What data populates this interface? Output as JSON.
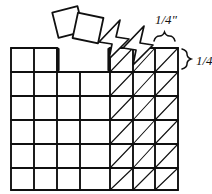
{
  "diagram": {
    "ink_color": "#101010",
    "paper_color": "#ffffff",
    "labels": {
      "top_measure": "1/4\"",
      "top_measure_numerator": "1",
      "top_measure_denominator": "4",
      "top_measure_unit": "”",
      "right_measure": "1/4\"",
      "right_measure_numerator": "1",
      "right_measure_denominator": "4",
      "right_measure_unit": "”"
    },
    "grid": {
      "columns": 7,
      "rows": 6,
      "cell_width_px": 24,
      "cell_height_px": 24,
      "left_px": 11,
      "top_px": 48,
      "right_px": 178,
      "bottom_px": 190,
      "x_lines": [
        11,
        34,
        57,
        80,
        110,
        133,
        155,
        178
      ],
      "y_lines": [
        48,
        72,
        96,
        120,
        144,
        168,
        190
      ],
      "top_row_segments": [
        {
          "from_x": 11,
          "to_x": 57,
          "hatched": false
        },
        {
          "from_x": 110,
          "to_x": 178,
          "hatched": true
        }
      ],
      "hatch_start_x": 110,
      "hatched_note": "diagonal lines run lower-left to upper-right"
    },
    "annotations": {
      "brace_top": {
        "from_x": 155,
        "to_x": 178,
        "y": 40
      },
      "brace_right": {
        "x": 185,
        "from_y": 48,
        "to_y": 72
      }
    },
    "squares": [
      {
        "name": "fabric-square-left",
        "cx": 68,
        "cy": 22,
        "size": 26,
        "rotation": -14
      },
      {
        "name": "fabric-square-right",
        "cx": 88,
        "cy": 28,
        "size": 26,
        "rotation": 12
      }
    ],
    "arrows": [
      {
        "name": "arrow-left",
        "points": "118,22 100,43 113,45 110,58 128,40 115,38"
      },
      {
        "name": "arrow-right",
        "points": "142,28 124,49 137,51 134,64 152,46 139,44"
      }
    ]
  }
}
